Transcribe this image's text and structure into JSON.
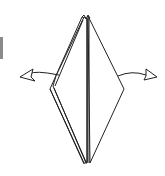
{
  "diagram": {
    "type": "origami-step",
    "colors": {
      "line": "#222222",
      "fill": "#ffffff",
      "edge_bar": "#8a8a8a"
    },
    "arrows": [
      {
        "name": "left-arrow",
        "direction": "left"
      },
      {
        "name": "right-arrow",
        "direction": "right"
      }
    ]
  }
}
